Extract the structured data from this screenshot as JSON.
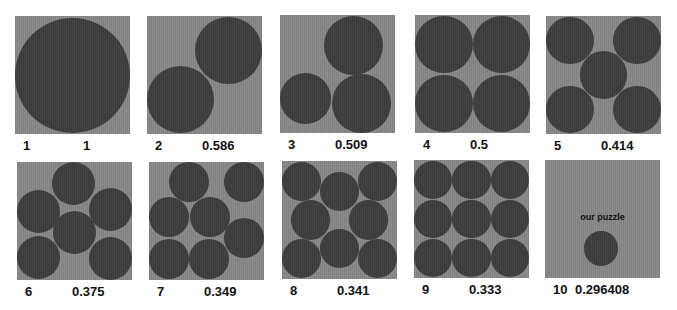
{
  "colors": {
    "box": "#8c8c8c",
    "circle": "#434343",
    "text": "#111111",
    "background": "#ffffff"
  },
  "panels": [
    {
      "n": "1",
      "value": "1",
      "x": 15,
      "y": 16,
      "circles": [
        [
          0.5,
          0.5,
          0.5
        ]
      ]
    },
    {
      "n": "2",
      "value": "0.586",
      "x": 147,
      "y": 16,
      "circles": [
        [
          0.293,
          0.707,
          0.293
        ],
        [
          0.707,
          0.293,
          0.293
        ]
      ]
    },
    {
      "n": "3",
      "value": "0.509",
      "x": 280,
      "y": 15,
      "circles": [
        [
          0.22,
          0.71,
          0.22
        ],
        [
          0.64,
          0.26,
          0.255
        ],
        [
          0.71,
          0.75,
          0.255
        ]
      ]
    },
    {
      "n": "4",
      "value": "0.5",
      "x": 415,
      "y": 15,
      "circles": [
        [
          0.25,
          0.25,
          0.25
        ],
        [
          0.75,
          0.25,
          0.25
        ],
        [
          0.25,
          0.75,
          0.25
        ],
        [
          0.75,
          0.75,
          0.25
        ]
      ]
    },
    {
      "n": "5",
      "value": "0.414",
      "x": 546,
      "y": 16,
      "circles": [
        [
          0.207,
          0.207,
          0.207
        ],
        [
          0.793,
          0.207,
          0.207
        ],
        [
          0.5,
          0.5,
          0.207
        ],
        [
          0.207,
          0.793,
          0.207
        ],
        [
          0.793,
          0.793,
          0.207
        ]
      ]
    },
    {
      "n": "6",
      "value": "0.375",
      "x": 17,
      "y": 162,
      "circles": [
        [
          0.19,
          0.42,
          0.187
        ],
        [
          0.49,
          0.18,
          0.187
        ],
        [
          0.81,
          0.4,
          0.187
        ],
        [
          0.5,
          0.6,
          0.187
        ],
        [
          0.19,
          0.81,
          0.187
        ],
        [
          0.81,
          0.82,
          0.187
        ]
      ]
    },
    {
      "n": "7",
      "value": "0.349",
      "x": 149,
      "y": 162,
      "circles": [
        [
          0.35,
          0.17,
          0.174
        ],
        [
          0.83,
          0.17,
          0.174
        ],
        [
          0.17,
          0.47,
          0.174
        ],
        [
          0.53,
          0.47,
          0.174
        ],
        [
          0.83,
          0.64,
          0.174
        ],
        [
          0.17,
          0.82,
          0.174
        ],
        [
          0.52,
          0.82,
          0.174
        ]
      ]
    },
    {
      "n": "8",
      "value": "0.341",
      "x": 282,
      "y": 161,
      "circles": [
        [
          0.17,
          0.17,
          0.17
        ],
        [
          0.5,
          0.26,
          0.17
        ],
        [
          0.83,
          0.17,
          0.17
        ],
        [
          0.25,
          0.5,
          0.17
        ],
        [
          0.75,
          0.5,
          0.17
        ],
        [
          0.17,
          0.83,
          0.17
        ],
        [
          0.5,
          0.74,
          0.17
        ],
        [
          0.83,
          0.83,
          0.17
        ]
      ]
    },
    {
      "n": "9",
      "value": "0.333",
      "x": 414,
      "y": 160,
      "circles": [
        [
          0.167,
          0.167,
          0.167
        ],
        [
          0.5,
          0.167,
          0.167
        ],
        [
          0.833,
          0.167,
          0.167
        ],
        [
          0.167,
          0.5,
          0.167
        ],
        [
          0.5,
          0.5,
          0.167
        ],
        [
          0.833,
          0.5,
          0.167
        ],
        [
          0.167,
          0.833,
          0.167
        ],
        [
          0.5,
          0.833,
          0.167
        ],
        [
          0.833,
          0.833,
          0.167
        ]
      ]
    },
    {
      "n": "10",
      "value": "0.296408",
      "x": 545,
      "y": 160,
      "note": "our puzzle",
      "circles": [
        [
          0.49,
          0.75,
          0.148
        ]
      ]
    }
  ]
}
